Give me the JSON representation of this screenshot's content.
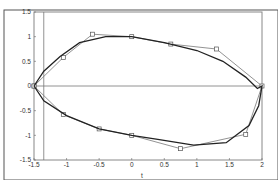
{
  "chart_data": {
    "type": "line",
    "title": "",
    "xlabel": "t",
    "ylabel": "",
    "xlim": [
      -1.5,
      2
    ],
    "ylim": [
      -1.5,
      1.5
    ],
    "grid": false,
    "xticks": [
      "-1.5",
      "-1",
      "-0.5",
      "0",
      "0.5",
      "1",
      "1.5",
      "2"
    ],
    "yticks": [
      "1.5",
      "1",
      "0.5",
      "0",
      "-0.5",
      "-1",
      "-1.5"
    ],
    "series": [
      {
        "name": "coarse polygon (markers)",
        "marker": "square",
        "x": [
          -1.5,
          -1.05,
          -0.6,
          0,
          0.6,
          1.3,
          2,
          1.75,
          0.75,
          0,
          -0.5,
          -1.05,
          -1.5
        ],
        "y": [
          0,
          0.58,
          1.05,
          1.0,
          0.85,
          0.75,
          0,
          -0.98,
          -1.27,
          -1.0,
          -0.87,
          -0.58,
          0
        ]
      },
      {
        "name": "smooth closed curve",
        "marker": "none",
        "x": [
          -1.5,
          -1.35,
          -1.1,
          -0.8,
          -0.4,
          0,
          0.5,
          1.0,
          1.4,
          1.75,
          1.93,
          2.0,
          1.95,
          1.8,
          1.45,
          0.95,
          0.4,
          0,
          -0.5,
          -1.0,
          -1.35,
          -1.5
        ],
        "y": [
          0,
          0.3,
          0.6,
          0.88,
          1.0,
          1.0,
          0.88,
          0.72,
          0.5,
          0.18,
          -0.05,
          0,
          -0.4,
          -0.8,
          -1.15,
          -1.2,
          -1.08,
          -1.0,
          -0.87,
          -0.6,
          -0.3,
          0
        ]
      }
    ],
    "reference_lines": [
      {
        "type": "horizontal",
        "y": 0,
        "x_from": -1.5,
        "x_to": 2
      },
      {
        "type": "vertical",
        "x": -1.35,
        "y_from": -1.5,
        "y_to": 1.5
      }
    ]
  }
}
